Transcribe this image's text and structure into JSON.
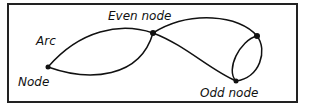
{
  "diagram": {
    "labels": {
      "arc": "Arc",
      "node": "Node",
      "even_node": "Even node",
      "odd_node": "Odd node"
    },
    "nodes": [
      {
        "id": "node",
        "type": "node"
      },
      {
        "id": "even",
        "type": "even node"
      },
      {
        "id": "right",
        "type": "node"
      },
      {
        "id": "odd",
        "type": "odd node"
      }
    ],
    "edges": [
      {
        "from": "node",
        "to": "even"
      },
      {
        "from": "node",
        "to": "even"
      },
      {
        "from": "even",
        "to": "right"
      },
      {
        "from": "even",
        "to": "odd"
      },
      {
        "from": "right",
        "to": "odd"
      },
      {
        "from": "right",
        "to": "odd"
      }
    ],
    "colors": {
      "stroke": "#111111",
      "background": "#ffffff"
    }
  }
}
